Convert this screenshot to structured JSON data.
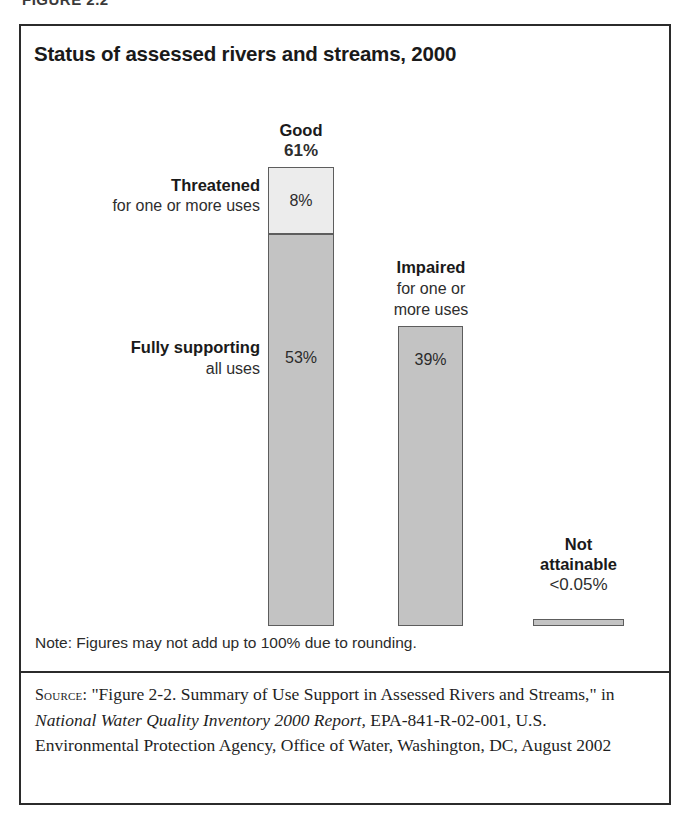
{
  "figure": {
    "caption_sliver": "FIGURE 2.2",
    "title": "Status of assessed rivers and streams, 2000",
    "note": "Note: Figures may not add up to 100% due to rounding.",
    "source": {
      "label": "Source:",
      "text_before_italic": " \"Figure 2-2. Summary of Use Support in Assessed Rivers and Streams,\" in ",
      "italic_title": "National Water Quality Inventory 2000 Report,",
      "text_after_italic": " EPA-841-R-02-001, U.S. Environmental Protection Agency, Office of Water, Washington, DC, August 2002"
    }
  },
  "labels": {
    "good": {
      "title": "Good",
      "value": "61%"
    },
    "threatened": {
      "title": "Threatened",
      "subtitle": "for one or more uses",
      "value": "8%"
    },
    "fully_supporting": {
      "title": "Fully supporting",
      "subtitle": "all uses",
      "value": "53%"
    },
    "impaired": {
      "title": "Impaired",
      "subtitle_line1": "for one or",
      "subtitle_line2": "more uses",
      "value": "39%"
    },
    "not_attainable": {
      "title_line1": "Not",
      "title_line2": "attainable",
      "value": "<0.05%"
    }
  },
  "colors": {
    "bar_light": "#ececec",
    "bar_medium": "#c3c3c3",
    "bar_outline": "#5d5d5d",
    "frame": "#2b2b2b",
    "text": "#1a1a1a"
  },
  "chart_data": {
    "type": "bar",
    "title": "Status of assessed rivers and streams, 2000",
    "subtitle": "",
    "xlabel": "",
    "ylabel": "Percent of assessed rivers and streams",
    "ylim": [
      0,
      100
    ],
    "grid": false,
    "legend_position": "none",
    "stacked": true,
    "units": "percent",
    "categories": [
      "Good",
      "Impaired for one or more uses",
      "Not attainable"
    ],
    "values": [
      61,
      39,
      0.05
    ],
    "series": [
      {
        "name": "Fully supporting all uses",
        "category": "Good",
        "value": 53,
        "label": "53%",
        "color": "#c3c3c3"
      },
      {
        "name": "Threatened for one or more uses",
        "category": "Good",
        "value": 8,
        "label": "8%",
        "color": "#ececec"
      },
      {
        "name": "Impaired for one or more uses",
        "category": "Impaired",
        "value": 39,
        "label": "39%",
        "color": "#c3c3c3"
      },
      {
        "name": "Not attainable",
        "category": "Not attainable",
        "value": 0.05,
        "label": "<0.05%",
        "color": "#c3c3c3"
      }
    ],
    "annotations": [
      "Good 61%",
      "Threatened for one or more uses 8%",
      "Fully supporting all uses 53%",
      "Impaired for one or more uses 39%",
      "Not attainable <0.05%"
    ],
    "note": "Note: Figures may not add up to 100% due to rounding."
  }
}
